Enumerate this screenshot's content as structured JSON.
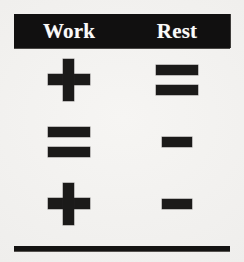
{
  "page": {
    "background_color": "#f2f1ef",
    "ink_color": "#1b1a19",
    "header_background_color": "#111010",
    "header_text_color": "#fbfbfa"
  },
  "table": {
    "columns": [
      {
        "key": "work",
        "label": "Work"
      },
      {
        "key": "rest",
        "label": "Rest"
      }
    ],
    "rows": [
      {
        "work_symbol": "+",
        "work_icon": "plus-icon",
        "rest_symbol": "=",
        "rest_icon": "equals-icon"
      },
      {
        "work_symbol": "=",
        "work_icon": "equals-icon",
        "rest_symbol": "-",
        "rest_icon": "minus-icon"
      },
      {
        "work_symbol": "+",
        "work_icon": "plus-icon",
        "rest_symbol": "-",
        "rest_icon": "minus-icon"
      }
    ]
  },
  "footer": {
    "rule_visible": true
  }
}
